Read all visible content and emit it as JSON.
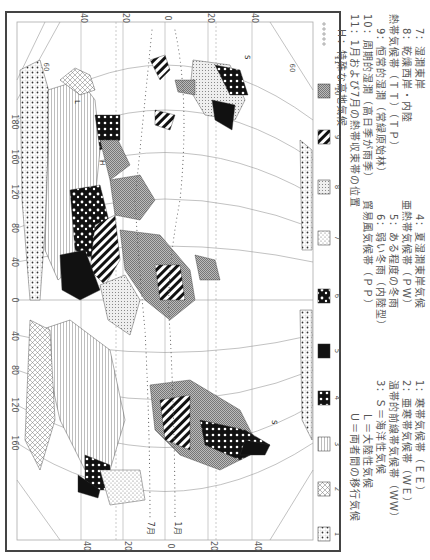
{
  "figure": {
    "type": "world-climate-map",
    "orientation": "rotated-90-clockwise",
    "longitude_ticks": [
      "180",
      "160",
      "120",
      "80",
      "40",
      "0",
      "40",
      "80",
      "120",
      "160"
    ],
    "latitude_ticks_top": [
      "40",
      "20",
      "0",
      "20",
      "40"
    ],
    "latitude_ticks_bottom": [
      "40",
      "20",
      "0",
      "20",
      "40"
    ],
    "parallel_labels": [
      "60",
      "60",
      "60"
    ],
    "itcz_labels": {
      "july": "7月",
      "january": "1月"
    },
    "map_letters": [
      "U",
      "L",
      "S",
      "H",
      "S",
      "L",
      "U"
    ]
  },
  "legend": {
    "swatches": [
      {
        "num": "1",
        "pattern": "dotted-grid"
      },
      {
        "num": "2",
        "pattern": "crosshatch-light"
      },
      {
        "num": "3",
        "pattern": "horizontal-lines"
      },
      {
        "num": "4",
        "pattern": "black-with-white-dots"
      },
      {
        "num": "5",
        "pattern": "solid-black"
      },
      {
        "num": "6",
        "pattern": "black-white-blotch"
      },
      {
        "num": "7",
        "pattern": "stipple-light"
      },
      {
        "num": "8",
        "pattern": "fine-dots"
      },
      {
        "num": "9",
        "pattern": "diagonal-stripes"
      },
      {
        "num": "10",
        "pattern": "gray-checker"
      },
      {
        "num": "11",
        "pattern": "open-circles"
      }
    ],
    "left_column": [
      "1：寒帯気候帯（ＥＥ）",
      "2：亜寒帯気候帯（ＷＥ）",
      "温帯的前線帯気候帯（ＷＷ）",
      "3：Ｓ＝海洋性気候",
      "Ｌ＝大陸性気候",
      "Ｕ＝両者間の移行気候"
    ],
    "middle_column": [
      "4：夏湿潤東岸気候",
      "亜熱帯気候帯（ＰＷ）",
      "5：ある程度の冬雨",
      "6：弱い冬雨（内陸型）",
      "貿易風気候帯（ＰＰ）"
    ],
    "right_column": [
      "7：湿潤東岸",
      "8：乾燥西岸・内陸",
      "熱帯気候帯（ＴＴ）（ＴＰ）",
      "9：恒常的湿潤（常緑原始林）",
      "10：周期的湿潤（高日季が雨季）",
      "11：1月および7月の熱帯収束帯の位置",
      "Ｈ：特殊な高地気候"
    ]
  }
}
